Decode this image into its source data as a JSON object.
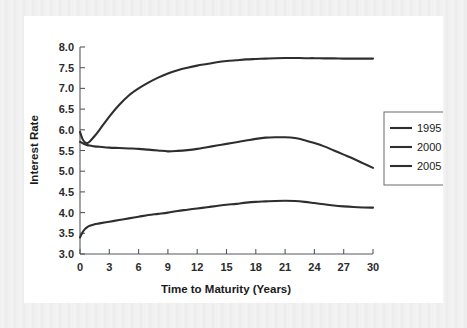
{
  "figure": {
    "background_color": "#ffffff",
    "border_color": "#f0f0f0",
    "line_color": "#2e2e2e",
    "axis_color": "#555a5e"
  },
  "chart_data": {
    "type": "line",
    "title": "",
    "subtitle": "",
    "xlabel": "Time to Maturity (Years)",
    "ylabel": "Interest Rate",
    "xlim": [
      0,
      30
    ],
    "ylim": [
      3.0,
      8.0
    ],
    "xticks": [
      0,
      3,
      6,
      9,
      12,
      15,
      18,
      21,
      24,
      27,
      30
    ],
    "yticks": [
      3.0,
      3.5,
      4.0,
      4.5,
      5.0,
      5.5,
      6.0,
      6.5,
      7.0,
      7.5,
      8.0
    ],
    "xtick_labels": [
      "0",
      "3",
      "6",
      "9",
      "12",
      "15",
      "18",
      "21",
      "24",
      "27",
      "30"
    ],
    "ytick_labels": [
      "3.0",
      "3.5",
      "4.0",
      "4.5",
      "5.0",
      "5.5",
      "6.0",
      "6.5",
      "7.0",
      "7.5",
      "8.0"
    ],
    "grid": false,
    "legend_position": "right",
    "x": [
      0,
      0.25,
      0.5,
      0.75,
      1,
      1.5,
      2,
      3,
      4,
      5,
      6,
      7,
      8,
      9,
      10,
      11,
      12,
      13,
      14,
      15,
      16,
      17,
      18,
      19,
      20,
      21,
      22,
      23,
      24,
      25,
      26,
      27,
      28,
      29,
      30
    ],
    "series": [
      {
        "name": "1995",
        "color": "#2e2e2e",
        "values": [
          5.95,
          5.78,
          5.7,
          5.68,
          5.72,
          5.85,
          6.0,
          6.32,
          6.6,
          6.83,
          7.0,
          7.14,
          7.26,
          7.36,
          7.44,
          7.5,
          7.55,
          7.59,
          7.63,
          7.66,
          7.68,
          7.7,
          7.71,
          7.72,
          7.73,
          7.735,
          7.735,
          7.73,
          7.73,
          7.725,
          7.725,
          7.72,
          7.72,
          7.72,
          7.72
        ]
      },
      {
        "name": "2000",
        "color": "#2e2e2e",
        "values": [
          5.71,
          5.68,
          5.65,
          5.63,
          5.62,
          5.6,
          5.59,
          5.57,
          5.56,
          5.55,
          5.54,
          5.52,
          5.5,
          5.48,
          5.49,
          5.51,
          5.54,
          5.58,
          5.62,
          5.66,
          5.7,
          5.74,
          5.78,
          5.81,
          5.82,
          5.82,
          5.8,
          5.75,
          5.68,
          5.6,
          5.5,
          5.4,
          5.3,
          5.19,
          5.08
        ]
      },
      {
        "name": "2005",
        "color": "#2e2e2e",
        "values": [
          3.4,
          3.52,
          3.6,
          3.65,
          3.68,
          3.72,
          3.74,
          3.78,
          3.82,
          3.86,
          3.9,
          3.94,
          3.97,
          4.0,
          4.04,
          4.07,
          4.1,
          4.13,
          4.16,
          4.19,
          4.21,
          4.24,
          4.26,
          4.27,
          4.28,
          4.285,
          4.28,
          4.26,
          4.23,
          4.2,
          4.17,
          4.15,
          4.135,
          4.125,
          4.12
        ]
      }
    ],
    "legend_entries": [
      "1995",
      "2000",
      "2005"
    ]
  }
}
